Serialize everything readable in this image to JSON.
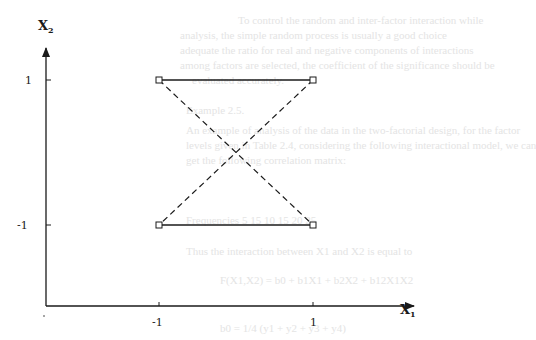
{
  "diagram": {
    "type": "geometry-plot",
    "axes": {
      "x": {
        "label": "X",
        "subscript": "1",
        "ticks": [
          {
            "value": -1,
            "label": "-1"
          },
          {
            "value": 1,
            "label": "1"
          }
        ]
      },
      "y": {
        "label": "X",
        "subscript": "2",
        "ticks": [
          {
            "value": 1,
            "label": "1"
          },
          {
            "value": -1,
            "label": "-1"
          }
        ]
      }
    },
    "points": [
      {
        "x": -1,
        "y": 1
      },
      {
        "x": 1,
        "y": 1
      },
      {
        "x": -1,
        "y": -1
      },
      {
        "x": 1,
        "y": -1
      }
    ],
    "solid_edges": [
      {
        "from": [
          -1,
          1
        ],
        "to": [
          1,
          1
        ]
      },
      {
        "from": [
          -1,
          -1
        ],
        "to": [
          1,
          -1
        ]
      }
    ],
    "dashed_edges": [
      {
        "from": [
          -1,
          1
        ],
        "to": [
          1,
          -1
        ]
      },
      {
        "from": [
          1,
          1
        ],
        "to": [
          -1,
          -1
        ]
      }
    ],
    "colors": {
      "ink": "#1a1a1a",
      "background": "#ffffff",
      "bleed_through": "#e4e4e4"
    }
  },
  "bleed_through_text": [
    "To control the random and inter-factor interaction while",
    "analysis, the simple random process is usually a good choice",
    "adequate the ratio for real and negative components of interactions",
    "among factors are selected, the coefficient of the significance should be",
    "evaluated accurately.",
    "Example 2.5.",
    "An example of analysis of the data in the two-factorial design, for the factor",
    "levels given in Table 2.4, considering the following interactional model, we can",
    "get the following correlation matrix:",
    "Frequencies   5   15   10   15   20   25",
    "Thus the interaction between X1 and X2 is equal to",
    "F(X1,X2) = b0 + b1X1 + b2X2 + b12X1X2",
    "b0 = 1/4 (y1 + y2 + y3 + y4)"
  ]
}
